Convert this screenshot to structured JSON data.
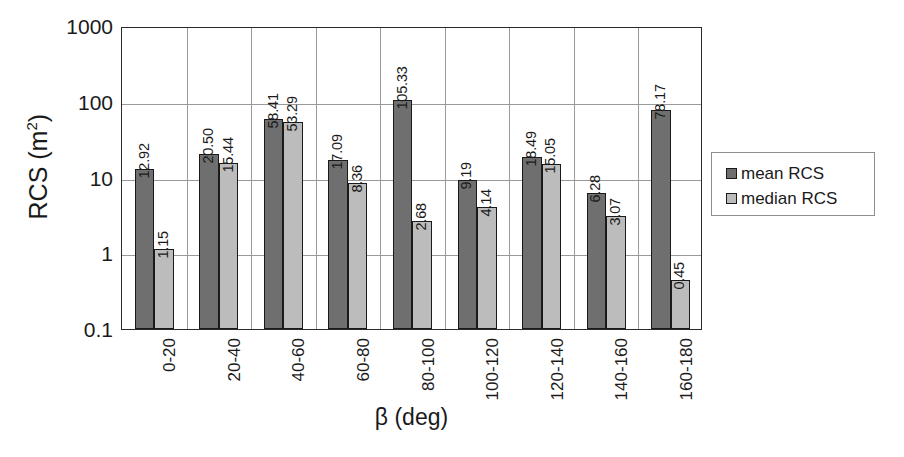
{
  "chart_data": {
    "type": "bar",
    "title": "",
    "subtitle": "",
    "xlabel": "β (deg)",
    "ylabel": "RCS (m²)",
    "ylabel_base": "RCS (m",
    "ylabel_sup": "2",
    "ylabel_close": ")",
    "yscale": "log",
    "ylim": [
      0.1,
      1000
    ],
    "ytick_labels": [
      "1000",
      "100",
      "10",
      "1",
      "0.1"
    ],
    "ytick_values": [
      1000,
      100,
      10,
      1,
      0.1
    ],
    "grid": "horizontal-and-vertical",
    "legend_position": "right",
    "categories": [
      "0-20",
      "20-40",
      "40-60",
      "60-80",
      "80-100",
      "100-120",
      "120-140",
      "140-160",
      "160-180"
    ],
    "series": [
      {
        "name": "mean RCS",
        "color": "#6f6f6f",
        "values": [
          12.92,
          20.5,
          58.41,
          17.09,
          105.33,
          9.19,
          18.49,
          6.28,
          78.17
        ],
        "labels": [
          "12.92",
          "20.50",
          "58.41",
          "17.09",
          "105.33",
          "9.19",
          "18.49",
          "6.28",
          "78.17"
        ]
      },
      {
        "name": "median RCS",
        "color": "#bcbcbc",
        "values": [
          1.15,
          15.44,
          53.29,
          8.36,
          2.68,
          4.14,
          15.05,
          3.07,
          0.45
        ],
        "labels": [
          "1.15",
          "15.44",
          "53.29",
          "8.36",
          "2.68",
          "4.14",
          "15.05",
          "3.07",
          "0.45"
        ]
      }
    ]
  },
  "legend": {
    "items": [
      {
        "label": "mean RCS",
        "color": "#6f6f6f"
      },
      {
        "label": "median RCS",
        "color": "#bcbcbc"
      }
    ]
  }
}
